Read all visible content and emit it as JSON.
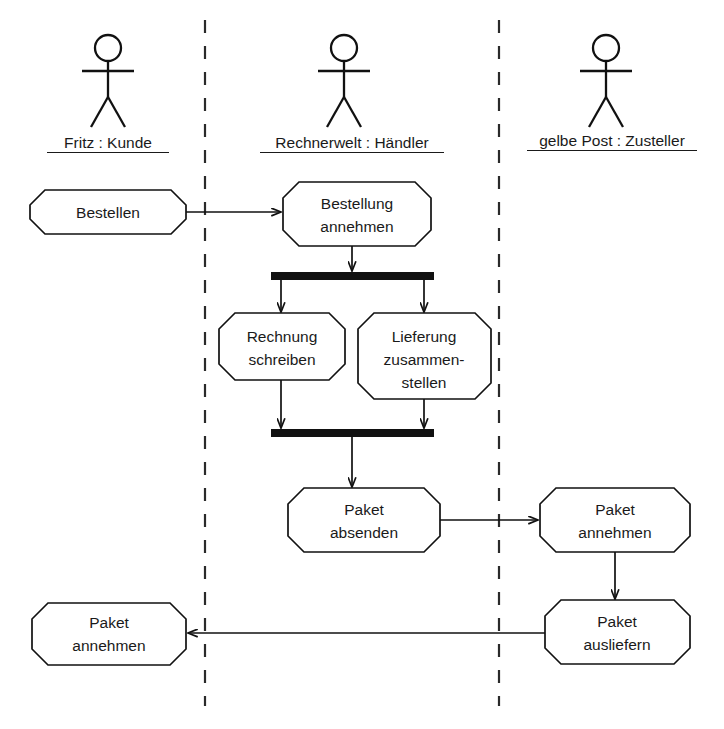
{
  "diagram": {
    "type": "activity-diagram",
    "background_color": "#ffffff",
    "line_color": "#111111",
    "text_color": "#1a1a1a"
  },
  "lanes": [
    {
      "id": "kunde",
      "label": "Fritz : Kunde",
      "actor_icon": "stick-figure-icon",
      "center_x": 108
    },
    {
      "id": "haendler",
      "label": "Rechnerwelt : Händler",
      "actor_icon": "stick-figure-icon",
      "center_x": 352
    },
    {
      "id": "zusteller",
      "label": "gelbe Post : Zusteller",
      "actor_icon": "stick-figure-icon",
      "center_x": 612
    }
  ],
  "dividers": [
    {
      "id": "divider-1",
      "x": 205,
      "y1": 20,
      "y2": 706
    },
    {
      "id": "divider-2",
      "x": 499,
      "y1": 20,
      "y2": 706
    }
  ],
  "nodes": [
    {
      "id": "bestellen",
      "lane": "kunde",
      "lines": [
        "Bestellen"
      ],
      "x": 30,
      "y": 190,
      "w": 156,
      "h": 44
    },
    {
      "id": "bestellung-annehmen",
      "lane": "haendler",
      "lines": [
        "Bestellung",
        "annehmen"
      ],
      "x": 283,
      "y": 182,
      "w": 148,
      "h": 64
    },
    {
      "id": "rechnung-schreiben",
      "lane": "haendler",
      "lines": [
        "Rechnung",
        "schreiben"
      ],
      "x": 219,
      "y": 313,
      "w": 126,
      "h": 67
    },
    {
      "id": "lieferung-zusammenstellen",
      "lane": "haendler",
      "lines": [
        "Lieferung",
        "zusammen-",
        "stellen"
      ],
      "x": 358,
      "y": 313,
      "w": 133,
      "h": 86
    },
    {
      "id": "paket-absenden",
      "lane": "haendler",
      "lines": [
        "Paket",
        "absenden"
      ],
      "x": 288,
      "y": 488,
      "w": 152,
      "h": 64
    },
    {
      "id": "paket-annehmen-post",
      "lane": "zusteller",
      "lines": [
        "Paket",
        "annehmen"
      ],
      "x": 540,
      "y": 488,
      "w": 150,
      "h": 64
    },
    {
      "id": "paket-ausliefern",
      "lane": "zusteller",
      "lines": [
        "Paket",
        "ausliefern"
      ],
      "x": 545,
      "y": 600,
      "w": 145,
      "h": 64
    },
    {
      "id": "paket-annehmen-kunde",
      "lane": "kunde",
      "lines": [
        "Paket",
        "annehmen"
      ],
      "x": 32,
      "y": 603,
      "w": 154,
      "h": 62
    }
  ],
  "bars": [
    {
      "id": "fork-bar",
      "kind": "fork",
      "x": 271,
      "y": 272,
      "w": 163,
      "h": 8
    },
    {
      "id": "join-bar",
      "kind": "join",
      "x": 271,
      "y": 429,
      "w": 163,
      "h": 8
    }
  ],
  "flows": [
    {
      "id": "flow-bestellen-to-annehmen",
      "from": "bestellen",
      "to": "bestellung-annehmen",
      "direction": "right"
    },
    {
      "id": "flow-annehmen-to-fork",
      "from": "bestellung-annehmen",
      "to": "fork-bar",
      "direction": "down"
    },
    {
      "id": "flow-fork-to-rechnung",
      "from": "fork-bar",
      "to": "rechnung-schreiben",
      "direction": "down"
    },
    {
      "id": "flow-fork-to-lieferung",
      "from": "fork-bar",
      "to": "lieferung-zusammenstellen",
      "direction": "down"
    },
    {
      "id": "flow-rechnung-to-join",
      "from": "rechnung-schreiben",
      "to": "join-bar",
      "direction": "down"
    },
    {
      "id": "flow-lieferung-to-join",
      "from": "lieferung-zusammenstellen",
      "to": "join-bar",
      "direction": "down"
    },
    {
      "id": "flow-join-to-absenden",
      "from": "join-bar",
      "to": "paket-absenden",
      "direction": "down"
    },
    {
      "id": "flow-absenden-to-annehmen-post",
      "from": "paket-absenden",
      "to": "paket-annehmen-post",
      "direction": "right"
    },
    {
      "id": "flow-annehmen-post-to-ausliefern",
      "from": "paket-annehmen-post",
      "to": "paket-ausliefern",
      "direction": "down"
    },
    {
      "id": "flow-ausliefern-to-annehmen-kunde",
      "from": "paket-ausliefern",
      "to": "paket-annehmen-kunde",
      "direction": "left"
    }
  ]
}
